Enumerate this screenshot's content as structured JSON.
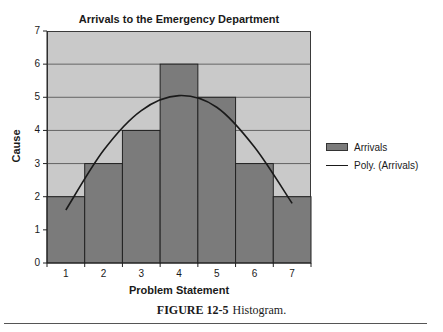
{
  "chart_data": {
    "type": "bar",
    "title": "Arrivals to the Emergency Department",
    "xlabel": "Problem Statement",
    "ylabel": "Cause",
    "categories": [
      "1",
      "2",
      "3",
      "4",
      "5",
      "6",
      "7"
    ],
    "series": [
      {
        "name": "Arrivals",
        "type": "bar",
        "values": [
          2,
          3,
          4,
          6,
          5,
          3,
          2
        ],
        "color": "#7b7b7b"
      },
      {
        "name": "Poly. (Arrivals)",
        "type": "line",
        "trendline": "polynomial",
        "values": [
          1.6,
          3.4,
          4.6,
          5.05,
          4.7,
          3.5,
          1.8
        ],
        "color": "#1a1a1a"
      }
    ],
    "ylim": [
      0,
      7
    ],
    "yticks": [
      0,
      1,
      2,
      3,
      4,
      5,
      6,
      7
    ],
    "grid": true,
    "legend_position": "right",
    "plot_background": "#c9c9c9"
  },
  "caption": {
    "label": "FIGURE 12-5",
    "text": "Histogram."
  }
}
